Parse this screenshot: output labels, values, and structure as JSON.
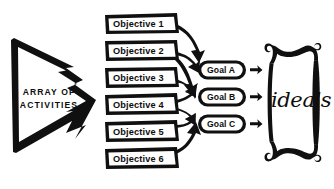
{
  "diagram": {
    "background_color": "#ffffff",
    "ink_color": "#101010"
  },
  "source_arrow": {
    "name": "array-of-activities-arrow",
    "line1": "ARRAY OF",
    "line2": "ACTIVITIES"
  },
  "objectives": [
    {
      "label": "Objective 1"
    },
    {
      "label": "Objective 2"
    },
    {
      "label": "Objective 3"
    },
    {
      "label": "Objective 4"
    },
    {
      "label": "Objective 5"
    },
    {
      "label": "Objective 6"
    }
  ],
  "goals": [
    {
      "label": "Goal A"
    },
    {
      "label": "Goal B"
    },
    {
      "label": "Goal C"
    }
  ],
  "ideals": {
    "label": "ideals",
    "frame": "ornate-scroll-cartouche"
  },
  "connections": [
    {
      "from": "Objective 1",
      "to": "Goal A"
    },
    {
      "from": "Objective 2",
      "to": "Goal A"
    },
    {
      "from": "Objective 2",
      "to": "Goal B"
    },
    {
      "from": "Objective 3",
      "to": "Goal B"
    },
    {
      "from": "Objective 4",
      "to": "Goal B"
    },
    {
      "from": "Objective 4",
      "to": "Goal C"
    },
    {
      "from": "Objective 5",
      "to": "Goal C"
    },
    {
      "from": "Objective 6",
      "to": "Goal C"
    },
    {
      "from": "Goal A",
      "to": "ideals"
    },
    {
      "from": "Goal B",
      "to": "ideals"
    },
    {
      "from": "Goal C",
      "to": "ideals"
    }
  ]
}
